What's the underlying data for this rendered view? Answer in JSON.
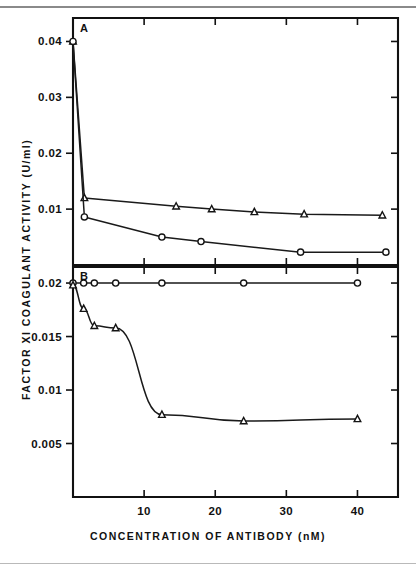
{
  "figure": {
    "y_axis_title": "FACTOR XI COAGULANT ACTIVITY (U/ml)",
    "x_axis_title": "CONCENTRATION OF ANTIBODY (nM)",
    "panel_a_label": "A",
    "panel_b_label": "B"
  },
  "chart_data": [
    {
      "type": "line",
      "panel": "A",
      "title": "A",
      "xlabel": "CONCENTRATION OF ANTIBODY (nM)",
      "ylabel": "FACTOR XI COAGULANT ACTIVITY (U/ml)",
      "xlim": [
        0,
        45.7
      ],
      "ylim": [
        0.0,
        0.0442
      ],
      "xticks": [
        10,
        20,
        30,
        40
      ],
      "xticklabels": [
        "10",
        "20",
        "30",
        "40"
      ],
      "yticks": [
        0.01,
        0.02,
        0.03,
        0.04
      ],
      "yticklabels": [
        "0.01",
        "0.02",
        "0.03",
        "0.04"
      ],
      "grid": false,
      "legend": "none",
      "series": [
        {
          "name": "triangle-series-A",
          "marker": "triangle",
          "x": [
            0,
            1.6,
            14.5,
            19.5,
            25.5,
            32.5,
            43.5
          ],
          "y": [
            0.04,
            0.012,
            0.0105,
            0.01,
            0.0095,
            0.0091,
            0.0089
          ]
        },
        {
          "name": "circle-series-A",
          "marker": "circle",
          "x": [
            0,
            1.6,
            12.5,
            18.0,
            32.0,
            44.0
          ],
          "y": [
            0.04,
            0.0086,
            0.005,
            0.0042,
            0.0023,
            0.0023
          ]
        }
      ]
    },
    {
      "type": "line",
      "panel": "B",
      "title": "B",
      "xlabel": "CONCENTRATION OF ANTIBODY (nM)",
      "ylabel": "FACTOR XI COAGULANT ACTIVITY (U/ml)",
      "xlim": [
        0,
        45.7
      ],
      "ylim": [
        0.0,
        0.0215
      ],
      "xticks": [
        10,
        20,
        30,
        40
      ],
      "xticklabels": [
        "10",
        "20",
        "30",
        "40"
      ],
      "yticks": [
        0.005,
        0.01,
        0.015,
        0.02
      ],
      "yticklabels": [
        "0.005",
        "0.01",
        "0.015",
        "0.02"
      ],
      "grid": false,
      "legend": "none",
      "series": [
        {
          "name": "circle-series-B",
          "marker": "circle",
          "x": [
            0,
            1.5,
            3.0,
            6.0,
            12.5,
            24.0,
            40.0
          ],
          "y": [
            0.02,
            0.02,
            0.02,
            0.02,
            0.02,
            0.02,
            0.02
          ]
        },
        {
          "name": "triangle-series-B",
          "marker": "triangle",
          "x": [
            0,
            1.5,
            3.0,
            6.0,
            12.5,
            24.0,
            40.0
          ],
          "y": [
            0.0198,
            0.0176,
            0.016,
            0.0158,
            0.0077,
            0.0071,
            0.0073
          ]
        }
      ]
    }
  ]
}
